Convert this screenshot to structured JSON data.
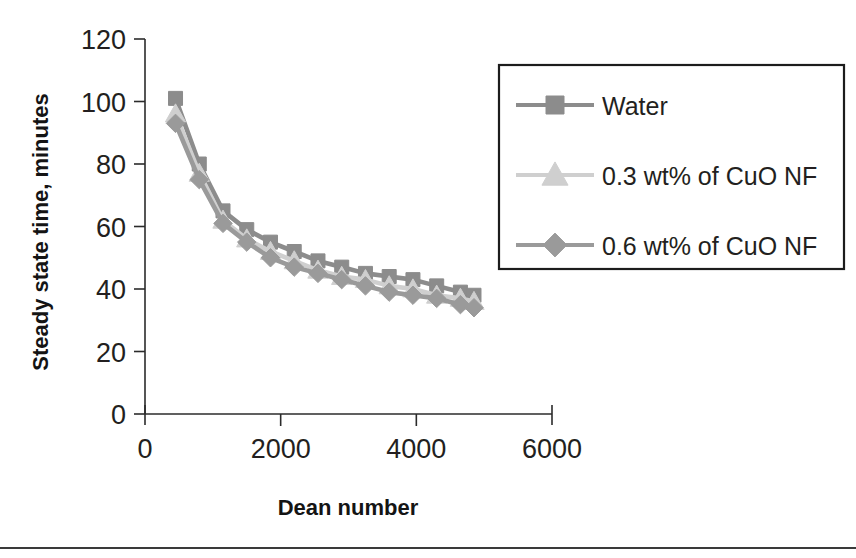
{
  "figure": {
    "background_color": "#ffffff",
    "bottom_rule": {
      "name": "page-divider",
      "y": 547,
      "color": "#3a3a3a"
    }
  },
  "chart_data": {
    "type": "line",
    "title": "",
    "subtitle": "",
    "xlabel": "Dean number",
    "ylabel": "Steady state time, minutes",
    "xlim": [
      0,
      6000
    ],
    "ylim": [
      0,
      120
    ],
    "xticks": [
      0,
      2000,
      4000,
      6000
    ],
    "yticks": [
      0,
      20,
      40,
      60,
      80,
      100,
      120
    ],
    "xtick_labels": [
      "0",
      "2000",
      "4000",
      "6000"
    ],
    "ytick_labels": [
      "0",
      "20",
      "40",
      "60",
      "80",
      "100",
      "120"
    ],
    "grid": false,
    "legend_position": "upper-right-outside",
    "x": [
      450,
      800,
      1150,
      1500,
      1850,
      2200,
      2550,
      2900,
      3250,
      3600,
      3950,
      4300,
      4650,
      4850
    ],
    "series": [
      {
        "name": "Water",
        "marker": "square",
        "color": "#8c8c8c",
        "line_color": "#8c8c8c",
        "values": [
          101,
          80,
          65,
          59,
          55,
          52,
          49,
          47,
          45,
          44,
          43,
          41,
          39,
          38
        ]
      },
      {
        "name": "0.3 wt% of CuO NF",
        "marker": "triangle",
        "color": "#cfcfcf",
        "line_color": "#cfcfcf",
        "values": [
          96,
          77,
          62,
          56,
          52,
          49,
          46,
          44,
          43,
          41,
          40,
          38,
          37,
          36
        ]
      },
      {
        "name": "0.6 wt% of CuO NF",
        "marker": "diamond",
        "color": "#9a9a9a",
        "line_color": "#9a9a9a",
        "values": [
          93,
          75,
          61,
          55,
          50,
          47,
          45,
          43,
          41,
          39,
          38,
          37,
          35,
          34
        ]
      }
    ]
  },
  "legend": {
    "name": "chart-legend",
    "entries": [
      {
        "label": "Water",
        "marker": "square",
        "color": "#8c8c8c"
      },
      {
        "label": "0.3 wt% of CuO NF",
        "marker": "triangle",
        "color": "#cfcfcf"
      },
      {
        "label": "0.6 wt% of CuO NF",
        "marker": "diamond",
        "color": "#9a9a9a"
      }
    ]
  }
}
